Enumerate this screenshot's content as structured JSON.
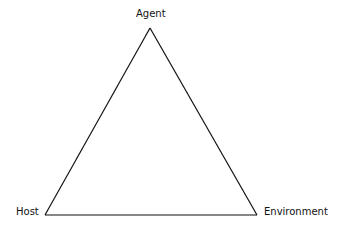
{
  "diagram": {
    "type": "triangle",
    "nodes": {
      "top": {
        "label": "Agent"
      },
      "bottom_left": {
        "label": "Host"
      },
      "bottom_right": {
        "label": "Environment"
      }
    },
    "edges": [
      {
        "from": "Agent",
        "to": "Host"
      },
      {
        "from": "Agent",
        "to": "Environment"
      },
      {
        "from": "Host",
        "to": "Environment"
      }
    ],
    "colors": {
      "line": "#111111",
      "text": "#111111",
      "background": "#ffffff"
    }
  }
}
